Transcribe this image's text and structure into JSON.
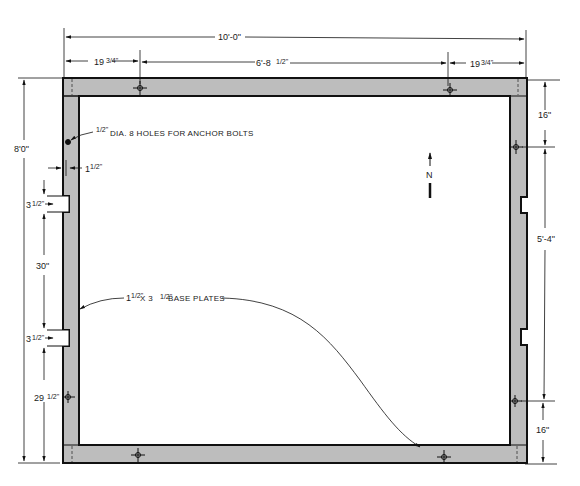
{
  "drawing": {
    "title": "Base plate layout plan",
    "colors": {
      "plate_fill": "#bdbdbd",
      "line": "#111111",
      "background": "#ffffff"
    },
    "overall_width": "10'-0\"",
    "overall_height": "8'0\"",
    "top_dims": {
      "left": "19 3/4\"",
      "middle": "6'-8 1/2\"",
      "right": "19 3/4\""
    },
    "top_dims_parts": {
      "left_whole": "19",
      "left_frac": "3/4\"",
      "middle_whole": "6'-8",
      "middle_frac": "1/2\"",
      "right_whole": "19",
      "right_frac": "3/4\""
    },
    "left_dims": {
      "notch_top": "3 1/2\"",
      "gap": "30\"",
      "notch_bottom": "3 1/2\"",
      "bottom": "29 1/2\"",
      "notch_top_whole": "3",
      "notch_top_frac": "1/2\"",
      "notch_bottom_whole": "3",
      "notch_bottom_frac": "1/2\"",
      "bottom_whole": "29",
      "bottom_frac": "1/2\""
    },
    "right_dims": {
      "top": "16\"",
      "middle": "5'-4\"",
      "bottom": "16\""
    },
    "plate_width": {
      "text": "1 1/2\"",
      "whole": "1",
      "frac": "1/2\""
    },
    "notes": {
      "anchor_bolts": "1/2\" DIA. 8 HOLES FOR ANCHOR BOLTS",
      "anchor_frac": "1/2\"",
      "anchor_text": "DIA.  8 HOLES FOR ANCHOR BOLTS",
      "base_plates": "1 1/2\" X 3 1/2\" BASE PLATES",
      "base_whole1": "1",
      "base_frac1": "1/2\"",
      "base_mid": "X 3",
      "base_frac2": "1/2\"",
      "base_text": "BASE PLATES"
    },
    "north_arrow": {
      "label": "N"
    },
    "anchor_holes": [
      {
        "x": 140,
        "y": 88
      },
      {
        "x": 450,
        "y": 90
      },
      {
        "x": 68,
        "y": 142
      },
      {
        "x": 516,
        "y": 147
      },
      {
        "x": 68,
        "y": 397
      },
      {
        "x": 515,
        "y": 401
      },
      {
        "x": 138,
        "y": 455
      },
      {
        "x": 444,
        "y": 457
      }
    ]
  }
}
